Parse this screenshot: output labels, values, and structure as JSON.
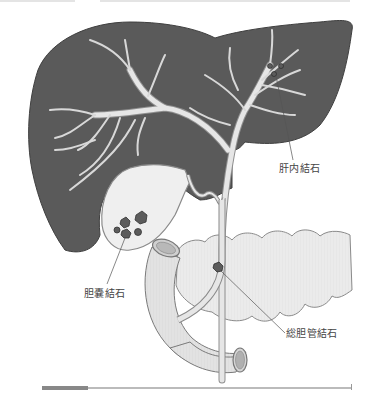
{
  "figure": {
    "labels": {
      "intrahepatic_stones": "肝内結石",
      "gallbladder_stones": "胆嚢結石",
      "common_bile_duct_stones": "総胆管結石"
    },
    "colors": {
      "liver": "#5a5a5a",
      "duct": "#e6e6e6",
      "duct_outline": "#8a8a8a",
      "gallbladder": "#efefef",
      "intestine": "#dedede",
      "pancreas": "#e9e9e9",
      "stone": "#5c5c5c",
      "leader_line": "#555555",
      "label_text": "#444444"
    }
  }
}
